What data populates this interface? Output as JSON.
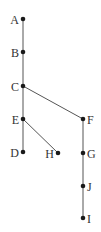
{
  "diagram": {
    "type": "tree",
    "colors": {
      "node": "#1a1a1a",
      "edge": "#555555",
      "label": "#333333"
    },
    "nodes": [
      {
        "id": "A",
        "label": "A",
        "x": 23,
        "y": 19,
        "label_side": "left"
      },
      {
        "id": "B",
        "label": "B",
        "x": 23,
        "y": 52,
        "label_side": "left"
      },
      {
        "id": "C",
        "label": "C",
        "x": 23,
        "y": 86,
        "label_side": "left"
      },
      {
        "id": "E",
        "label": "E",
        "x": 23,
        "y": 119,
        "label_side": "left"
      },
      {
        "id": "D",
        "label": "D",
        "x": 23,
        "y": 152,
        "label_side": "left"
      },
      {
        "id": "H",
        "label": "H",
        "x": 58,
        "y": 153,
        "label_side": "left"
      },
      {
        "id": "F",
        "label": "F",
        "x": 83,
        "y": 119,
        "label_side": "right"
      },
      {
        "id": "G",
        "label": "G",
        "x": 83,
        "y": 153,
        "label_side": "right"
      },
      {
        "id": "J",
        "label": "J",
        "x": 83,
        "y": 186,
        "label_side": "right"
      },
      {
        "id": "I",
        "label": "I",
        "x": 83,
        "y": 218,
        "label_side": "right"
      }
    ],
    "edges": [
      [
        "A",
        "B"
      ],
      [
        "B",
        "C"
      ],
      [
        "C",
        "E"
      ],
      [
        "E",
        "D"
      ],
      [
        "E",
        "H"
      ],
      [
        "C",
        "F"
      ],
      [
        "F",
        "G"
      ],
      [
        "G",
        "J"
      ],
      [
        "J",
        "I"
      ]
    ]
  }
}
